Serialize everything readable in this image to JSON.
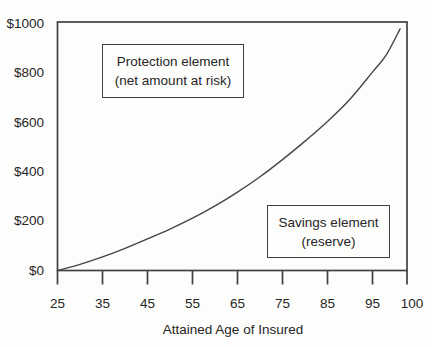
{
  "chart_data": {
    "type": "line",
    "title": "",
    "xlabel": "Attained Age of Insured",
    "ylabel": "",
    "x_tick_labels": [
      "25",
      "35",
      "45",
      "55",
      "65",
      "75",
      "85",
      "95",
      "100"
    ],
    "x_tick_values": [
      25,
      35,
      45,
      55,
      65,
      75,
      85,
      95,
      100
    ],
    "y_tick_labels": [
      "$0",
      "$200",
      "$400",
      "$600",
      "$800",
      "$1000"
    ],
    "y_tick_values": [
      0,
      200,
      400,
      600,
      800,
      1000
    ],
    "xlim": [
      25,
      100
    ],
    "ylim": [
      0,
      1000
    ],
    "grid": false,
    "legend": "none",
    "series": [
      {
        "name": "reserve-curve",
        "x": [
          25,
          30,
          35,
          40,
          45,
          50,
          55,
          60,
          65,
          70,
          75,
          80,
          85,
          90,
          95,
          97,
          99
        ],
        "y": [
          0,
          25,
          55,
          90,
          128,
          168,
          212,
          262,
          318,
          380,
          450,
          525,
          605,
          695,
          805,
          875,
          980
        ]
      }
    ],
    "annotations": [
      {
        "line1": "Protection element",
        "line2": "(net amount at risk)",
        "position": "upper-left-inside-plot"
      },
      {
        "line1": "Savings element",
        "line2": "(reserve)",
        "position": "lower-right-inside-plot"
      }
    ],
    "colors": {
      "line": "#454545",
      "axis": "#404040",
      "text": "#262626",
      "background": "#fdfdfc"
    }
  }
}
